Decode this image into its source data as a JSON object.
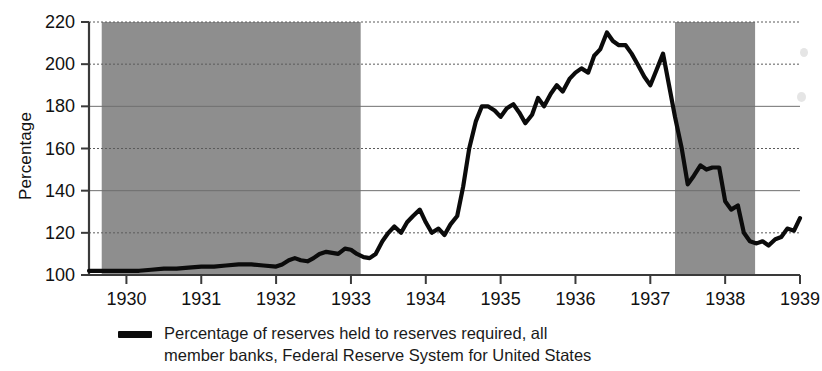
{
  "chart_data": {
    "type": "line",
    "title": "",
    "xlabel": "",
    "ylabel": "Percentage",
    "ylim": [
      100,
      220
    ],
    "xlim": [
      1929.5,
      1939.0
    ],
    "yticks": [
      100,
      120,
      140,
      160,
      180,
      200,
      220
    ],
    "xticks": [
      1930,
      1931,
      1932,
      1933,
      1934,
      1935,
      1936,
      1937,
      1938,
      1939
    ],
    "grid": true,
    "legend_position": "bottom-center",
    "series": [
      {
        "name": "Percentage of reserves held to reserves required, all member banks, Federal Reserve System for United States",
        "color": "#0b0b0b",
        "x": [
          1929.5,
          1929.67,
          1929.83,
          1930.0,
          1930.17,
          1930.33,
          1930.5,
          1930.67,
          1930.83,
          1931.0,
          1931.17,
          1931.33,
          1931.5,
          1931.67,
          1931.83,
          1932.0,
          1932.08,
          1932.17,
          1932.25,
          1932.33,
          1932.42,
          1932.5,
          1932.58,
          1932.67,
          1932.75,
          1932.83,
          1932.92,
          1933.0,
          1933.08,
          1933.17,
          1933.25,
          1933.33,
          1933.42,
          1933.5,
          1933.58,
          1933.67,
          1933.75,
          1933.83,
          1933.92,
          1934.0,
          1934.08,
          1934.17,
          1934.25,
          1934.33,
          1934.42,
          1934.5,
          1934.58,
          1934.67,
          1934.75,
          1934.83,
          1934.92,
          1935.0,
          1935.08,
          1935.17,
          1935.25,
          1935.33,
          1935.42,
          1935.5,
          1935.58,
          1935.67,
          1935.75,
          1935.83,
          1935.92,
          1936.0,
          1936.08,
          1936.17,
          1936.25,
          1936.33,
          1936.42,
          1936.5,
          1936.58,
          1936.67,
          1936.75,
          1936.83,
          1936.92,
          1937.0,
          1937.08,
          1937.17,
          1937.25,
          1937.33,
          1937.42,
          1937.5,
          1937.58,
          1937.67,
          1937.75,
          1937.83,
          1937.92,
          1938.0,
          1938.08,
          1938.17,
          1938.25,
          1938.33,
          1938.42,
          1938.5,
          1938.58,
          1938.67,
          1938.75,
          1938.83,
          1938.92,
          1939.0
        ],
        "y": [
          102,
          102,
          102,
          102,
          102,
          102.5,
          103,
          103,
          103.5,
          104,
          104,
          104.5,
          105,
          105,
          104.5,
          104,
          105,
          107,
          108,
          107,
          106.5,
          108,
          110,
          111,
          110.5,
          110,
          112.5,
          112,
          110,
          108.5,
          108,
          110,
          116,
          120,
          123,
          120,
          125,
          128,
          131,
          125,
          120,
          122,
          119,
          124,
          128,
          142,
          160,
          173,
          180,
          180,
          178,
          175,
          179,
          181,
          177,
          172,
          176,
          184,
          180,
          186,
          190,
          187,
          193,
          196,
          198,
          196,
          204,
          207,
          215,
          211,
          209,
          209,
          205,
          200,
          194,
          190,
          197,
          205,
          190,
          175,
          160,
          143,
          147,
          152,
          150,
          151,
          151,
          135,
          131,
          133,
          120,
          116,
          115,
          116,
          114,
          117,
          118,
          122,
          121,
          127
        ]
      }
    ],
    "shaded_bands": [
      {
        "name": "recession-band-1",
        "x0": 1929.67,
        "x1": 1933.13,
        "color": "#8e8e8e"
      },
      {
        "name": "recession-band-2",
        "x0": 1937.33,
        "x1": 1938.4,
        "color": "#8e8e8e"
      }
    ]
  },
  "legend": {
    "line1": "Percentage of reserves held to reserves required, all",
    "line2": "member banks, Federal Reserve System for United States"
  },
  "axis": {
    "y_title": "Percentage"
  }
}
